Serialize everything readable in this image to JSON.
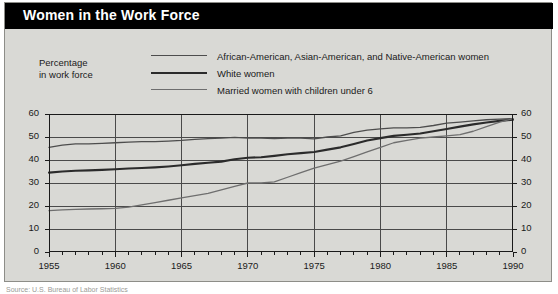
{
  "title": "Women in the Work Force",
  "axis_caption_line1": "Percentage",
  "axis_caption_line2": "in work force",
  "source_note": "Source: U.S. Bureau of Labor Statistics",
  "colors": {
    "banner_bg": "#000000",
    "banner_text": "#ffffff",
    "panel_bg": "#d9d9d5",
    "panel_border": "#8d8d88",
    "axis": "#1a1a1a",
    "grid": "#4a4a4a",
    "series_minority": "#4d4d4d",
    "series_white": "#2b2b2b",
    "series_married": "#6e6e6e"
  },
  "chart_data": {
    "type": "line",
    "title": "Women in the Work Force",
    "xlabel": "",
    "ylabel": "Percentage in work force",
    "xlim": [
      1955,
      1990
    ],
    "ylim": [
      0,
      60
    ],
    "grid": true,
    "legend_position": "top",
    "xticks": [
      1955,
      1960,
      1965,
      1970,
      1975,
      1980,
      1985,
      1990
    ],
    "xtick_labels": [
      "1955",
      "1960",
      "1965",
      "1970",
      "1975",
      "1980",
      "1985",
      "1990"
    ],
    "minor_xtick_interval": 1,
    "yticks": [
      0,
      10,
      20,
      30,
      40,
      50,
      60
    ],
    "ytick_labels": [
      "0",
      "10",
      "20",
      "30",
      "40",
      "50",
      "60"
    ],
    "y_axis_mirrored": true,
    "x": [
      1955,
      1956,
      1957,
      1958,
      1959,
      1960,
      1961,
      1962,
      1963,
      1964,
      1965,
      1966,
      1967,
      1968,
      1969,
      1970,
      1971,
      1972,
      1973,
      1974,
      1975,
      1976,
      1977,
      1978,
      1979,
      1980,
      1981,
      1982,
      1983,
      1984,
      1985,
      1986,
      1987,
      1988,
      1989,
      1990
    ],
    "series": [
      {
        "name": "African-American, Asian-American, and Native-American women",
        "color": "#4d4d4d",
        "values": [
          45.5,
          46.5,
          47.0,
          47.0,
          47.2,
          47.5,
          47.8,
          48.0,
          48.0,
          48.2,
          48.5,
          49.0,
          49.3,
          49.5,
          49.8,
          49.5,
          49.5,
          49.3,
          49.5,
          49.5,
          49.2,
          50.0,
          50.5,
          52.0,
          53.0,
          53.5,
          54.0,
          54.0,
          54.2,
          55.0,
          56.0,
          56.5,
          57.0,
          57.5,
          57.8,
          58.0
        ]
      },
      {
        "name": "White women",
        "color": "#2b2b2b",
        "values": [
          34.5,
          35.0,
          35.3,
          35.5,
          35.7,
          36.0,
          36.3,
          36.5,
          36.8,
          37.2,
          37.7,
          38.3,
          38.8,
          39.3,
          40.3,
          41.0,
          41.2,
          41.8,
          42.5,
          43.0,
          43.5,
          44.5,
          45.5,
          47.0,
          48.5,
          49.5,
          50.5,
          51.0,
          51.5,
          52.5,
          53.5,
          54.5,
          55.5,
          56.3,
          57.0,
          57.5
        ]
      },
      {
        "name": "Married women with children under 6",
        "color": "#6e6e6e",
        "values": [
          18.0,
          18.3,
          18.5,
          18.7,
          18.8,
          19.0,
          19.5,
          20.5,
          21.5,
          22.5,
          23.5,
          24.5,
          25.5,
          27.0,
          28.5,
          30.0,
          30.0,
          30.5,
          32.5,
          34.5,
          36.5,
          38.0,
          39.5,
          41.5,
          43.5,
          45.5,
          47.5,
          48.5,
          49.5,
          50.0,
          50.5,
          51.0,
          52.5,
          54.5,
          56.5,
          58.0
        ]
      }
    ]
  }
}
